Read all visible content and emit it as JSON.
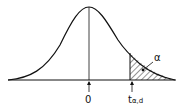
{
  "figure": {
    "type": "t-distribution density curve with shaded right-tail area",
    "origin_label": "0",
    "critical_value_label": "t",
    "critical_value_subscript": "α,d",
    "tail_area_label": "α",
    "colors": {
      "line": "#111111",
      "background": "#ffffff"
    }
  }
}
